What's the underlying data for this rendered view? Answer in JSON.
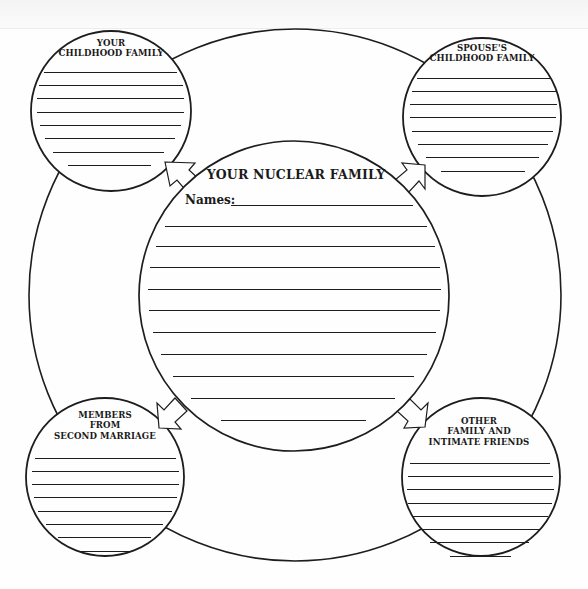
{
  "worksheet": {
    "outer_circle": {
      "cx": 295,
      "cy": 295,
      "r": 266
    },
    "center": {
      "title": "YOUR NUCLEAR FAMILY",
      "names_label": "Names:",
      "circle": {
        "cx": 294,
        "cy": 296,
        "r": 155
      },
      "blank_lines": 11
    },
    "circles": [
      {
        "id": "your-childhood-family",
        "title_lines": [
          "YOUR",
          "CHILDHOOD FAMILY"
        ],
        "cx": 111,
        "cy": 111,
        "r": 80,
        "blank_lines": 8
      },
      {
        "id": "spouses-childhood-family",
        "title_lines": [
          "SPOUSE'S",
          "CHILDHOOD FAMILY"
        ],
        "cx": 482,
        "cy": 117,
        "r": 79,
        "blank_lines": 8
      },
      {
        "id": "members-from-second-marriage",
        "title_lines": [
          "MEMBERS",
          "FROM",
          "SECOND MARRIAGE"
        ],
        "cx": 105,
        "cy": 477,
        "r": 79,
        "blank_lines": 8
      },
      {
        "id": "other-family-and-intimate-friends",
        "title_lines": [
          "OTHER",
          "FAMILY AND",
          "INTIMATE FRIENDS"
        ],
        "cx": 481,
        "cy": 477,
        "r": 79,
        "blank_lines": 8
      }
    ],
    "arrows": [
      {
        "from": "your-nuclear-family",
        "to": "your-childhood-family",
        "direction": "up-left"
      },
      {
        "from": "your-nuclear-family",
        "to": "spouses-childhood-family",
        "direction": "up-right"
      },
      {
        "from": "your-nuclear-family",
        "to": "members-from-second-marriage",
        "direction": "down-left"
      },
      {
        "from": "your-nuclear-family",
        "to": "other-family-and-intimate-friends",
        "direction": "down-right"
      }
    ],
    "colors": {
      "ink": "#1d1d1d",
      "paper": "#fefefe"
    }
  }
}
